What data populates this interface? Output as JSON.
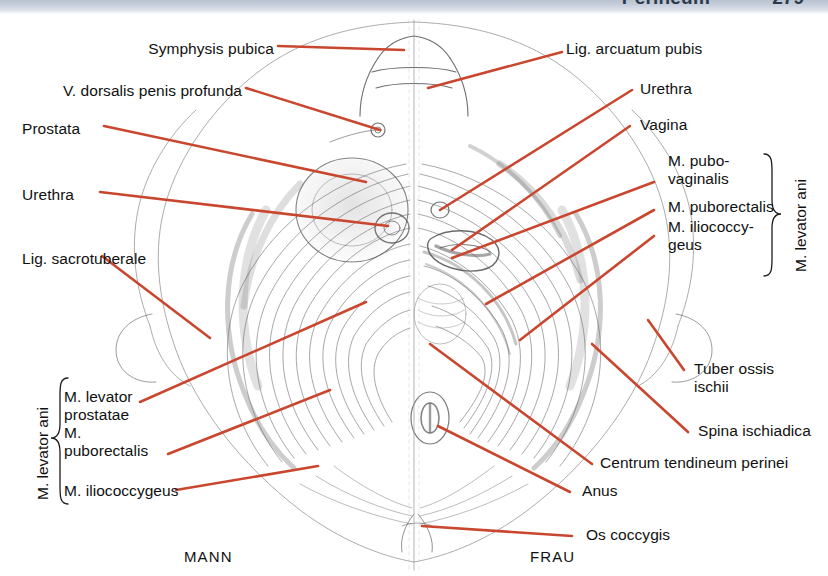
{
  "header": {
    "title": "Perineum",
    "page_number": "279",
    "band_color": "#c7cedb",
    "text_color": "#2b3a4a"
  },
  "figure": {
    "name": "pelvic-floor-male-female-comparison",
    "leader_color": "#c9472f",
    "ink_color": "#3a3a3a",
    "midline": "vertical dividing line between male (left) and female (right) halves"
  },
  "captions": {
    "left": "MANN",
    "right": "FRAU"
  },
  "labels_left": [
    {
      "id": "symphysis-pubica",
      "text": "Symphysis pubica"
    },
    {
      "id": "v-dorsalis-penis-profunda",
      "text": "V. dorsalis penis profunda"
    },
    {
      "id": "prostata",
      "text": "Prostata"
    },
    {
      "id": "urethra-male",
      "text": "Urethra"
    },
    {
      "id": "lig-sacrotuberale",
      "text": "Lig. sacrotuberale"
    }
  ],
  "labels_right": [
    {
      "id": "lig-arcuatum-pubis",
      "text": "Lig. arcuatum pubis"
    },
    {
      "id": "urethra-female",
      "text": "Urethra"
    },
    {
      "id": "vagina",
      "text": "Vagina"
    },
    {
      "id": "tuber-ossis-ischii",
      "text": "Tuber ossis\nischii"
    },
    {
      "id": "spina-ischiadica",
      "text": "Spina ischiadica"
    },
    {
      "id": "centrum-tendineum-perinei",
      "text": "Centrum tendineum perinei"
    },
    {
      "id": "anus",
      "text": "Anus"
    },
    {
      "id": "os-coccygis",
      "text": "Os coccygis"
    }
  ],
  "bracket_left": {
    "group_label": "M. levator ani",
    "items": [
      {
        "id": "m-levator-prostatae",
        "text": "M. levator\nprostatae"
      },
      {
        "id": "m-puborectalis-male",
        "text": "M.\npuborectalis"
      },
      {
        "id": "m-iliococcygeus-male",
        "text": "M. iliococcygeus"
      }
    ]
  },
  "bracket_right": {
    "group_label": "M. levator ani",
    "items": [
      {
        "id": "m-pubovaginalis",
        "text": "M. pubo-\nvaginalis"
      },
      {
        "id": "m-puborectalis-female",
        "text": "M. puborectalis"
      },
      {
        "id": "m-iliococcygeus-female",
        "text": "M. iliococcy-\ngeus"
      }
    ]
  }
}
